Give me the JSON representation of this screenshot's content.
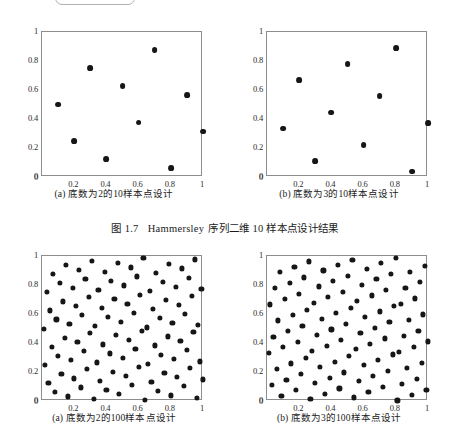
{
  "page": {
    "background": "#ffffff",
    "dot_color": "#161616",
    "axis_color": "#8d8d8d"
  },
  "top_widget": {
    "name": "cut-off-slider-fragment",
    "handle": "open-circle-handle"
  },
  "figure_caption": {
    "number": "图 1.7",
    "title_latin": "Hammersley",
    "title_cn": "序列二维 10 样本点设计结果",
    "full": "图 1.7   Hammersley 序列二维 10 样本点设计结果"
  },
  "chart_data": [
    {
      "id": "top-left",
      "type": "scatter",
      "title": "(a) 底数为2的10样本点设计",
      "base": 2,
      "n_points": 10,
      "xlabel": "",
      "ylabel": "",
      "xlim": [
        0,
        1
      ],
      "ylim": [
        0,
        1
      ],
      "grid": false,
      "legend": "none",
      "xticks": [
        0,
        0.2,
        0.4,
        0.6,
        0.8,
        1
      ],
      "xtick_labels": [
        "0",
        "0.2",
        "0.4",
        "0.6",
        "0.8",
        "1"
      ],
      "yticks": [
        0,
        0.2,
        0.4,
        0.6,
        0.8,
        1
      ],
      "ytick_labels": [
        "0",
        "0.2",
        "0.4",
        "0.6",
        "0.8",
        "1"
      ],
      "x": [
        0.1,
        0.2,
        0.3,
        0.4,
        0.5,
        0.6,
        0.7,
        0.8,
        0.9,
        1.0
      ],
      "y": [
        0.5,
        0.25,
        0.75,
        0.125,
        0.625,
        0.375,
        0.875,
        0.0625,
        0.5625,
        0.3125
      ]
    },
    {
      "id": "top-right",
      "type": "scatter",
      "title": "(b) 底数为3的10样本点设计",
      "base": 3,
      "n_points": 10,
      "xlabel": "",
      "ylabel": "",
      "xlim": [
        0,
        1
      ],
      "ylim": [
        0,
        1
      ],
      "grid": false,
      "legend": "none",
      "xticks": [
        0,
        0.2,
        0.4,
        0.6,
        0.8,
        1
      ],
      "xtick_labels": [
        "0",
        "0.2",
        "0.4",
        "0.6",
        "0.8",
        "1"
      ],
      "yticks": [
        0,
        0.2,
        0.4,
        0.6,
        0.8,
        1
      ],
      "ytick_labels": [
        "0",
        "0.2",
        "0.4",
        "0.6",
        "0.8",
        "1"
      ],
      "x": [
        0.1,
        0.2,
        0.3,
        0.4,
        0.5,
        0.6,
        0.7,
        0.8,
        0.9,
        1.0
      ],
      "y": [
        0.3333,
        0.6667,
        0.1111,
        0.4444,
        0.7778,
        0.2222,
        0.5556,
        0.8889,
        0.037,
        0.3704
      ]
    },
    {
      "id": "bottom-left",
      "type": "scatter",
      "title": "(a) 底数为2的100样本点设计",
      "base": 2,
      "n_points": 100,
      "xlabel": "",
      "ylabel": "",
      "xlim": [
        0,
        1
      ],
      "ylim": [
        0,
        1
      ],
      "grid": false,
      "legend": "none",
      "xticks": [
        0,
        0.2,
        0.4,
        0.6,
        0.8,
        1
      ],
      "xtick_labels": [
        "0",
        "0.2",
        "0.4",
        "0.6",
        "0.8",
        "1"
      ],
      "yticks": [
        0,
        0.2,
        0.4,
        0.6,
        0.8,
        1
      ],
      "ytick_labels": [
        "0",
        "0.2",
        "0.4",
        "0.6",
        "0.8",
        "1"
      ],
      "generator": "hammersley",
      "note": "x = i/100 for i=1..100 ; y = radical inverse of i in base 2"
    },
    {
      "id": "bottom-right",
      "type": "scatter",
      "title": "(b) 底数为3的100样本点设计",
      "base": 3,
      "n_points": 100,
      "xlabel": "",
      "ylabel": "",
      "xlim": [
        0,
        1
      ],
      "ylim": [
        0,
        1
      ],
      "grid": false,
      "legend": "none",
      "xticks": [
        0,
        0.2,
        0.4,
        0.6,
        0.8,
        1
      ],
      "xtick_labels": [
        "0",
        "0.2",
        "0.4",
        "0.6",
        "0.8",
        "1"
      ],
      "yticks": [
        0,
        0.2,
        0.4,
        0.6,
        0.8,
        1
      ],
      "ytick_labels": [
        "0",
        "0.2",
        "0.4",
        "0.6",
        "0.8",
        "1"
      ],
      "generator": "hammersley",
      "note": "x = i/100 for i=1..100 ; y = radical inverse of i in base 3"
    }
  ]
}
